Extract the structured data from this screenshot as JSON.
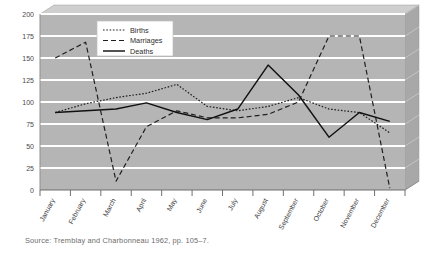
{
  "figure": {
    "source_note": "Source: Tremblay and Charbonneau 1962, pp. 105–7."
  },
  "chart_data": {
    "type": "line",
    "title": "",
    "subtitle": "",
    "xlabel": "",
    "ylabel": "",
    "ylim": [
      0,
      200
    ],
    "ytick_step": 25,
    "yticks": [
      "0",
      "25",
      "50",
      "75",
      "100",
      "125",
      "150",
      "175",
      "200"
    ],
    "grid": true,
    "grid_color": "#ffffff",
    "plot_background": "#b5b5b5",
    "legend_position": "top-center",
    "categories": [
      "January",
      "February",
      "March",
      "April",
      "May",
      "June",
      "July",
      "August",
      "September",
      "October",
      "November",
      "December"
    ],
    "series": [
      {
        "name": "Births",
        "style": "dotted",
        "color": "#1f1f1f",
        "values": [
          88,
          98,
          105,
          110,
          120,
          95,
          90,
          95,
          105,
          92,
          88,
          65
        ]
      },
      {
        "name": "Marriages",
        "style": "dashed",
        "color": "#1f1f1f",
        "values": [
          150,
          168,
          10,
          72,
          90,
          82,
          82,
          86,
          100,
          175,
          175,
          2
        ]
      },
      {
        "name": "Deaths",
        "style": "solid",
        "color": "#111111",
        "values": [
          88,
          90,
          92,
          99,
          88,
          80,
          92,
          142,
          108,
          60,
          88,
          78
        ]
      }
    ]
  }
}
